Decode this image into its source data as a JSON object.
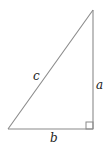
{
  "diagram": {
    "type": "right-triangle",
    "colors": {
      "stroke": "#8a8a8a",
      "label": "#222222"
    },
    "vertices": {
      "top": [
        93,
        10
      ],
      "bottom_left": [
        8,
        129
      ],
      "bottom_right": [
        93,
        129
      ]
    },
    "labels": {
      "hypotenuse": "c",
      "vertical_leg": "a",
      "horizontal_leg": "b"
    },
    "right_angle_marker": true
  }
}
